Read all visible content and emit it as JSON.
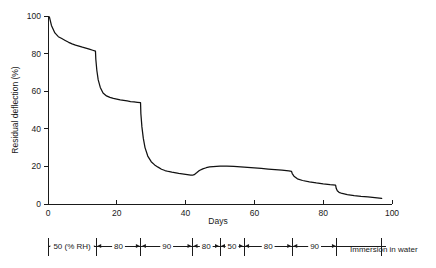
{
  "chart_data": {
    "type": "line",
    "title": "",
    "xlabel": "Days",
    "ylabel": "Residual deflection (%)",
    "xlim": [
      0,
      100
    ],
    "ylim": [
      0,
      100
    ],
    "grid": false,
    "legend": "none",
    "x_ticks": [
      "0",
      "20",
      "40",
      "60",
      "80",
      "100"
    ],
    "x_tick_values": [
      0,
      20,
      40,
      60,
      80,
      100
    ],
    "y_ticks": [
      "0",
      "20",
      "40",
      "60",
      "80",
      "100"
    ],
    "y_tick_values": [
      0,
      20,
      40,
      60,
      80,
      100
    ],
    "series": [
      {
        "name": "Residual deflection",
        "x": [
          0.4,
          1,
          2,
          3,
          4,
          5,
          6,
          7,
          8,
          9,
          10,
          11,
          12,
          13,
          13.8,
          13.9,
          14.2,
          14.6,
          15.2,
          16,
          17,
          18,
          19,
          20,
          21,
          22,
          23,
          24,
          25,
          26,
          26.9,
          27.0,
          27.3,
          27.7,
          28.2,
          29,
          30,
          31,
          32,
          33,
          34,
          35,
          36,
          38,
          40,
          41.5,
          42,
          42.5,
          43.2,
          44,
          45,
          46,
          47,
          48,
          50,
          52,
          54,
          56,
          58,
          60,
          62,
          64,
          66,
          68,
          70,
          70.8,
          71,
          71.5,
          72.5,
          74,
          76,
          78,
          80,
          82,
          83.6,
          83.8,
          84.1,
          84.6,
          85.5,
          87,
          89,
          91,
          93,
          95,
          97
        ],
        "y": [
          99.5,
          95,
          91,
          89,
          88,
          87,
          86,
          85.2,
          84.5,
          84,
          83.4,
          82.9,
          82.4,
          81.8,
          81.3,
          77,
          71,
          66,
          62,
          59,
          57.5,
          56.7,
          56.2,
          55.8,
          55.4,
          55.1,
          54.8,
          54.5,
          54.3,
          54.1,
          53.9,
          48,
          41,
          35,
          30,
          25.5,
          22.5,
          20.8,
          19.6,
          18.5,
          17.8,
          17.3,
          16.9,
          16.3,
          15.8,
          15.4,
          15.3,
          15.6,
          16.6,
          17.8,
          18.7,
          19.3,
          19.7,
          19.9,
          20.2,
          20.2,
          20.0,
          19.8,
          19.5,
          19.2,
          18.9,
          18.6,
          18.3,
          18.0,
          17.6,
          17.3,
          16.2,
          14.8,
          13.4,
          12.5,
          11.8,
          11.2,
          10.7,
          10.3,
          10.1,
          8.2,
          7.0,
          6.2,
          5.6,
          5.0,
          4.5,
          4.1,
          3.8,
          3.4,
          3.0
        ]
      }
    ],
    "annotation_bar": {
      "label_trailing": "Immersion in water",
      "boundaries_days": [
        0,
        14,
        27,
        42,
        50,
        57,
        71,
        84,
        97
      ],
      "segments": [
        {
          "label": "50 (% RH)",
          "start_day": 0,
          "end_day": 14
        },
        {
          "label": "80",
          "start_day": 14,
          "end_day": 27
        },
        {
          "label": "90",
          "start_day": 27,
          "end_day": 42
        },
        {
          "label": "80",
          "start_day": 42,
          "end_day": 50
        },
        {
          "label": "50",
          "start_day": 50,
          "end_day": 57
        },
        {
          "label": "80",
          "start_day": 57,
          "end_day": 71
        },
        {
          "label": "90",
          "start_day": 71,
          "end_day": 84
        }
      ]
    }
  },
  "colors": {
    "curve": "#111111",
    "axis": "#1a1a1a",
    "background": "#ffffff"
  }
}
